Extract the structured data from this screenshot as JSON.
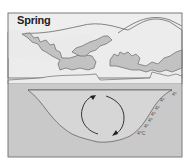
{
  "diagram": {
    "title": "Spring",
    "colors": {
      "frame_border": "#7a7a7a",
      "sky": "#eeeeee",
      "hills": "#ececec",
      "clouds": "#c2c2c2",
      "water": "#cfcfcf",
      "ground": "#c9c9c9",
      "outline": "#555555",
      "arrow": "#333333"
    },
    "temperature_labels": [
      {
        "text": "4°",
        "x": 172,
        "y": 92
      },
      {
        "text": "4°",
        "x": 160,
        "y": 98
      },
      {
        "text": "4°",
        "x": 155,
        "y": 106
      },
      {
        "text": "4°",
        "x": 151,
        "y": 112
      },
      {
        "text": "4°",
        "x": 148,
        "y": 118
      },
      {
        "text": "4°",
        "x": 144,
        "y": 124
      },
      {
        "text": "4°C",
        "x": 137,
        "y": 131
      }
    ],
    "circulation": {
      "description": "Circular mixing arrows indicating spring turnover",
      "direction": "clockwise"
    }
  }
}
